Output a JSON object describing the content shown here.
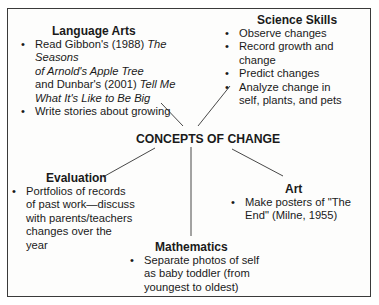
{
  "diagram": {
    "center": "CONCEPTS OF CHANGE",
    "language_arts": {
      "title": "Language Arts",
      "items": [
        {
          "pre": "Read Gibbon's (1988) ",
          "em1": "The Seasons of Arnold's Apple Tree",
          "mid": "and Dunbar's (2001) ",
          "em2": "Tell Me What It's Like to Be Big"
        },
        {
          "text": "Write stories about growing"
        }
      ],
      "em1_line1": "The Seasons",
      "em1_line2": "of Arnold's Apple Tree",
      "em2_line1": "Tell Me",
      "em2_line2": "What It's Like to Be Big"
    },
    "science_skills": {
      "title": "Science Skills",
      "items": [
        "Observe changes",
        "Record growth and change",
        "Predict changes",
        "Analyze change in self, plants, and pets"
      ]
    },
    "evaluation": {
      "title": "Evaluation",
      "items": [
        "Portfolios of records of past work—discuss with parents/teachers changes over the year"
      ]
    },
    "art": {
      "title": "Art",
      "items": [
        "Make posters of \"The End\" (Milne, 1955)"
      ]
    },
    "mathematics": {
      "title": "Mathematics",
      "items": [
        "Separate photos of self as baby toddler (from youngest to oldest)"
      ]
    }
  }
}
